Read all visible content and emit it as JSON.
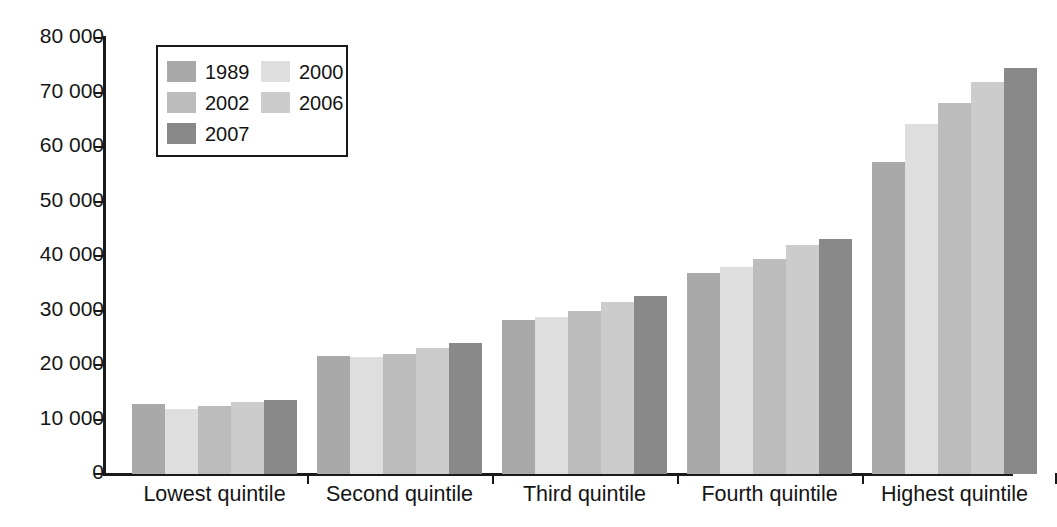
{
  "chart_data": {
    "type": "bar",
    "title": "",
    "subtitle": "",
    "xlabel": "",
    "ylabel": "",
    "grid": false,
    "legend_position": "inside-top-left",
    "orientation": "vertical-grouped",
    "categories": [
      "Lowest quintile",
      "Second quintile",
      "Third quintile",
      "Fourth quintile",
      "Highest quintile"
    ],
    "ylim": [
      0,
      80000
    ],
    "ytick_values": [
      0,
      10000,
      20000,
      30000,
      40000,
      50000,
      60000,
      70000,
      80000
    ],
    "ytick_labels": [
      "0",
      "10 000",
      "20 000",
      "30 000",
      "40 000",
      "50 000",
      "60 000",
      "70 000",
      "80 000"
    ],
    "series": [
      {
        "name": "1989",
        "color": "#a9a9a9",
        "values": [
          12900,
          21700,
          28300,
          36800,
          57200
        ]
      },
      {
        "name": "2000",
        "color": "#dedede",
        "values": [
          11900,
          21500,
          28900,
          38000,
          64200
        ]
      },
      {
        "name": "2002",
        "color": "#bcbcbc",
        "values": [
          12400,
          22000,
          30000,
          39500,
          68000
        ]
      },
      {
        "name": "2006",
        "color": "#cccccc",
        "values": [
          13200,
          23200,
          31500,
          42000,
          72000
        ]
      },
      {
        "name": "2007",
        "color": "#898989",
        "values": [
          13500,
          24100,
          32700,
          43200,
          74500
        ]
      }
    ]
  },
  "legend": {
    "columns": [
      [
        {
          "label": "1989",
          "color": "#a9a9a9"
        },
        {
          "label": "2002",
          "color": "#bcbcbc"
        },
        {
          "label": "2007",
          "color": "#898989"
        }
      ],
      [
        {
          "label": "2000",
          "color": "#dedede"
        },
        {
          "label": "2006",
          "color": "#cccccc"
        }
      ]
    ]
  },
  "colors": {
    "axis": "#1a1a1a",
    "text": "#151515",
    "background": "#ffffff"
  }
}
